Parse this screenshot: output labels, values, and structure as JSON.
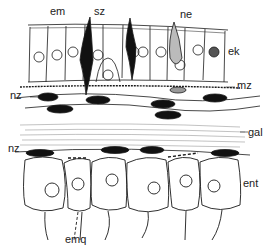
{
  "figure": {
    "type": "histological-diagram",
    "ink_color": "#1a1a1a",
    "background": "#ffffff"
  },
  "labels": {
    "em": "em",
    "sz": "sz",
    "ne": "ne",
    "ek": "ek",
    "mz": "mz",
    "nz_top": "nz",
    "gal": "gal",
    "nz_bottom": "nz",
    "ent": "ent",
    "emq": "emq"
  }
}
